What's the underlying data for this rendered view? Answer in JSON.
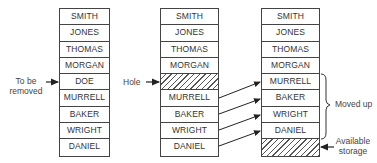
{
  "columns": [
    {
      "name": "before",
      "cells": [
        "SMITH",
        "JONES",
        "THOMAS",
        "MORGAN",
        "DOE",
        "MURRELL",
        "BAKER",
        "WRIGHT",
        "DANIEL"
      ],
      "hatched": []
    },
    {
      "name": "hole",
      "cells": [
        "SMITH",
        "JONES",
        "THOMAS",
        "MORGAN",
        "",
        "MURRELL",
        "BAKER",
        "WRIGHT",
        "DANIEL"
      ],
      "hatched": [
        4
      ]
    },
    {
      "name": "after",
      "cells": [
        "SMITH",
        "JONES",
        "THOMAS",
        "MORGAN",
        "MURRELL",
        "BAKER",
        "WRIGHT",
        "DANIEL",
        ""
      ],
      "hatched": [
        8
      ]
    }
  ],
  "labels": {
    "to_be_removed_1": "To be",
    "to_be_removed_2": "removed",
    "hole": "Hole",
    "moved_up": "Moved up",
    "available_1": "Available",
    "available_2": "storage"
  }
}
